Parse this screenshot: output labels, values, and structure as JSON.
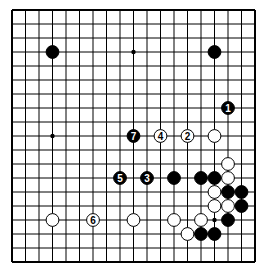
{
  "board": {
    "size": 19,
    "origin": {
      "x": 12,
      "y": 10
    },
    "spacing": {
      "x": 13.5,
      "y": 14
    },
    "line_color": "#000000",
    "background": "#ffffff",
    "hoshi": [
      [
        3,
        3
      ],
      [
        9,
        3
      ],
      [
        15,
        3
      ],
      [
        3,
        9
      ],
      [
        9,
        9
      ],
      [
        15,
        9
      ],
      [
        3,
        15
      ],
      [
        9,
        15
      ],
      [
        15,
        15
      ]
    ]
  },
  "stones": [
    {
      "color": "black",
      "col": 3,
      "row": 3,
      "label": ""
    },
    {
      "color": "black",
      "col": 15,
      "row": 3,
      "label": ""
    },
    {
      "color": "black",
      "col": 16,
      "row": 7,
      "label": "1"
    },
    {
      "color": "black",
      "col": 9,
      "row": 9,
      "label": "7"
    },
    {
      "color": "white",
      "col": 11,
      "row": 9,
      "label": "4"
    },
    {
      "color": "white",
      "col": 13,
      "row": 9,
      "label": "2"
    },
    {
      "color": "white",
      "col": 15,
      "row": 9,
      "label": ""
    },
    {
      "color": "white",
      "col": 16,
      "row": 11,
      "label": ""
    },
    {
      "color": "black",
      "col": 8,
      "row": 12,
      "label": "5"
    },
    {
      "color": "black",
      "col": 10,
      "row": 12,
      "label": "3"
    },
    {
      "color": "black",
      "col": 12,
      "row": 12,
      "label": ""
    },
    {
      "color": "black",
      "col": 14,
      "row": 12,
      "label": ""
    },
    {
      "color": "black",
      "col": 15,
      "row": 12,
      "label": ""
    },
    {
      "color": "white",
      "col": 16,
      "row": 12,
      "label": ""
    },
    {
      "color": "white",
      "col": 15,
      "row": 13,
      "label": ""
    },
    {
      "color": "black",
      "col": 16,
      "row": 13,
      "label": ""
    },
    {
      "color": "black",
      "col": 17,
      "row": 13,
      "label": ""
    },
    {
      "color": "white",
      "col": 15,
      "row": 14,
      "label": ""
    },
    {
      "color": "white",
      "col": 16,
      "row": 14,
      "label": ""
    },
    {
      "color": "black",
      "col": 17,
      "row": 14,
      "label": ""
    },
    {
      "color": "white",
      "col": 3,
      "row": 15,
      "label": ""
    },
    {
      "color": "white",
      "col": 6,
      "row": 15,
      "label": "6"
    },
    {
      "color": "white",
      "col": 9,
      "row": 15,
      "label": ""
    },
    {
      "color": "white",
      "col": 12,
      "row": 15,
      "label": ""
    },
    {
      "color": "white",
      "col": 14,
      "row": 15,
      "label": ""
    },
    {
      "color": "black",
      "col": 16,
      "row": 15,
      "label": ""
    },
    {
      "color": "white",
      "col": 13,
      "row": 16,
      "label": ""
    },
    {
      "color": "black",
      "col": 14,
      "row": 16,
      "label": ""
    },
    {
      "color": "black",
      "col": 15,
      "row": 16,
      "label": ""
    }
  ]
}
